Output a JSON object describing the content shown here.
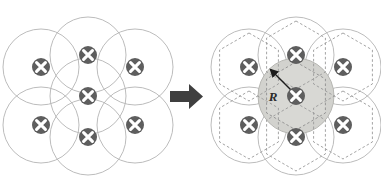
{
  "figure": {
    "name": "hexagonal-close-packing-cell-radius-diagram",
    "background_color": "#ffffff",
    "arrow": {
      "label": "transforms-to-arrow",
      "direction": "right",
      "color": "#3f3f3f"
    },
    "labels": {
      "radius": "R"
    },
    "colors": {
      "circle_outline": "#b4b4b4",
      "hexagon_dashed": "#9a9a9a",
      "shaded_cell_fill": "#d8d8d4",
      "shaded_circle_fill": "#d2d2ce",
      "atom_fill": "#5e5e5e",
      "atom_cross": "#ffffff",
      "arrow_color": "#3f3f3f",
      "radius_arrow": "#1c1c1c",
      "label_color": "#2b2b2b"
    },
    "left_panel": {
      "name": "unit-circles-packing",
      "center": [
        88,
        96
      ],
      "circle_radius": 38,
      "lattice_spacing": 47,
      "atom_radius": 9,
      "atoms": [
        {
          "id": "center",
          "cx": 88,
          "cy": 96
        },
        {
          "id": "top",
          "cx": 88,
          "cy": 55
        },
        {
          "id": "bottom",
          "cx": 88,
          "cy": 137
        },
        {
          "id": "upper-left",
          "cx": 41,
          "cy": 67
        },
        {
          "id": "upper-right",
          "cx": 135,
          "cy": 67
        },
        {
          "id": "lower-left",
          "cx": 41,
          "cy": 125
        },
        {
          "id": "lower-right",
          "cx": 135,
          "cy": 125
        }
      ]
    },
    "right_panel": {
      "name": "wigner-seitz-cells-packing",
      "center": [
        296,
        96
      ],
      "circle_radius": 38,
      "hexagon_radius": 34,
      "atom_radius": 9,
      "shaded_cell_id": "center",
      "radius_vector": {
        "from": [
          296,
          96
        ],
        "to": [
          271,
          70
        ]
      },
      "atoms": [
        {
          "id": "center",
          "cx": 296,
          "cy": 96
        },
        {
          "id": "top",
          "cx": 296,
          "cy": 55
        },
        {
          "id": "bottom",
          "cx": 296,
          "cy": 137
        },
        {
          "id": "upper-left",
          "cx": 249,
          "cy": 67
        },
        {
          "id": "upper-right",
          "cx": 343,
          "cy": 67
        },
        {
          "id": "lower-left",
          "cx": 249,
          "cy": 125
        },
        {
          "id": "lower-right",
          "cx": 343,
          "cy": 125
        }
      ]
    }
  }
}
